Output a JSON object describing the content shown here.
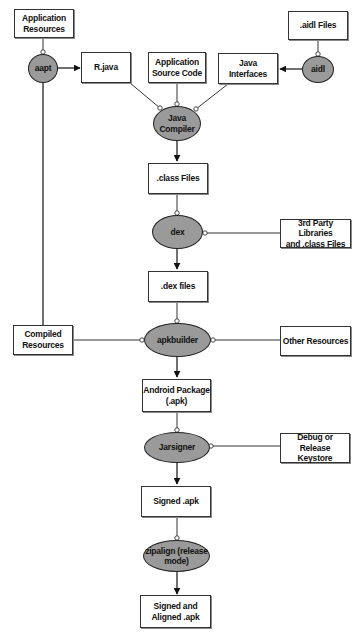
{
  "diagram": {
    "type": "flowchart",
    "colors": {
      "process_fill": "#9a9a9a",
      "artifact_fill": "#ffffff",
      "stroke": "#222222"
    },
    "artifacts": {
      "app_resources": "Application\nResources",
      "aidl_files": ".aidl Files",
      "r_java": "R.java",
      "app_source": "Application\nSource Code",
      "java_interfaces": "Java\nInterfaces",
      "class_files": ".class Files",
      "third_party": "3rd Party Libraries\nand .class Files",
      "dex_files": ".dex files",
      "compiled_resources": "Compiled\nResources",
      "other_resources": "Other Resources",
      "android_package": "Android Package\n(.apk)",
      "keystore": "Debug or Release\nKeystore",
      "signed_apk": "Signed .apk",
      "signed_aligned_apk": "Signed and\nAligned .apk"
    },
    "processes": {
      "aapt": "aapt",
      "aidl": "aidl",
      "java_compiler": "Java\nCompiler",
      "dex": "dex",
      "apkbuilder": "apkbuilder",
      "jarsigner": "Jarsigner",
      "zipalign": "zipalign (release\nmode)"
    },
    "edges": [
      {
        "from": "Application Resources",
        "to": "aapt",
        "kind": "input"
      },
      {
        "from": "aapt",
        "to": "R.java",
        "kind": "output"
      },
      {
        "from": "aapt",
        "to": "Compiled Resources",
        "kind": "output"
      },
      {
        "from": ".aidl Files",
        "to": "aidl",
        "kind": "input"
      },
      {
        "from": "aidl",
        "to": "Java Interfaces",
        "kind": "output"
      },
      {
        "from": "R.java",
        "to": "Java Compiler",
        "kind": "input"
      },
      {
        "from": "Application Source Code",
        "to": "Java Compiler",
        "kind": "input"
      },
      {
        "from": "Java Interfaces",
        "to": "Java Compiler",
        "kind": "input"
      },
      {
        "from": "Java Compiler",
        "to": ".class Files",
        "kind": "output"
      },
      {
        "from": ".class Files",
        "to": "dex",
        "kind": "input"
      },
      {
        "from": "3rd Party Libraries and .class Files",
        "to": "dex",
        "kind": "input"
      },
      {
        "from": "dex",
        "to": ".dex files",
        "kind": "output"
      },
      {
        "from": ".dex files",
        "to": "apkbuilder",
        "kind": "input"
      },
      {
        "from": "Compiled Resources",
        "to": "apkbuilder",
        "kind": "input"
      },
      {
        "from": "Other Resources",
        "to": "apkbuilder",
        "kind": "input"
      },
      {
        "from": "apkbuilder",
        "to": "Android Package (.apk)",
        "kind": "output"
      },
      {
        "from": "Android Package (.apk)",
        "to": "Jarsigner",
        "kind": "input"
      },
      {
        "from": "Debug or Release Keystore",
        "to": "Jarsigner",
        "kind": "input"
      },
      {
        "from": "Jarsigner",
        "to": "Signed .apk",
        "kind": "output"
      },
      {
        "from": "Signed .apk",
        "to": "zipalign (release mode)",
        "kind": "input"
      },
      {
        "from": "zipalign (release mode)",
        "to": "Signed and Aligned .apk",
        "kind": "output"
      }
    ]
  }
}
